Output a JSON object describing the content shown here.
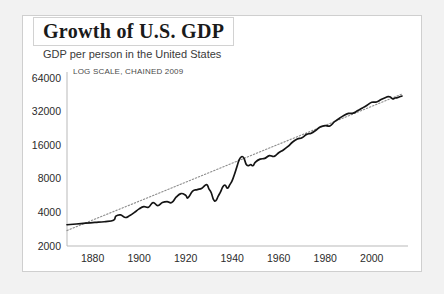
{
  "card": {
    "title": "Growth of U.S. GDP",
    "subtitle": "GDP per person in the United States"
  },
  "chart_data": {
    "type": "line",
    "title": "Growth of U.S. GDP",
    "subtitle": "GDP per person in the United States",
    "annotation": "LOG SCALE, CHAINED 2009",
    "xlabel": "",
    "ylabel": "",
    "yscale": "log2",
    "ylim": [
      2000,
      64000
    ],
    "xlim": [
      1869,
      2013
    ],
    "grid": false,
    "legend": "none",
    "yticks": [
      2000,
      4000,
      8000,
      16000,
      32000,
      64000
    ],
    "ytick_labels": [
      "2000",
      "4000",
      "8000",
      "16000",
      "32000",
      "64000"
    ],
    "xticks": [
      1880,
      1900,
      1920,
      1940,
      1960,
      1980,
      2000
    ],
    "xtick_labels": [
      "1880",
      "1900",
      "1920",
      "1940",
      "1960",
      "1980",
      "2000"
    ],
    "series": [
      {
        "name": "GDP per person",
        "style": "solid",
        "color": "#141414",
        "x": [
          1869,
          1873,
          1877,
          1881,
          1885,
          1889,
          1890,
          1892,
          1894,
          1896,
          1898,
          1900,
          1902,
          1904,
          1906,
          1908,
          1910,
          1912,
          1914,
          1916,
          1918,
          1920,
          1921,
          1923,
          1925,
          1927,
          1929,
          1930,
          1931,
          1932,
          1933,
          1934,
          1935,
          1936,
          1937,
          1938,
          1939,
          1940,
          1941,
          1942,
          1943,
          1944,
          1945,
          1946,
          1947,
          1948,
          1949,
          1950,
          1952,
          1954,
          1956,
          1958,
          1960,
          1962,
          1964,
          1966,
          1968,
          1970,
          1972,
          1974,
          1976,
          1978,
          1980,
          1982,
          1984,
          1986,
          1988,
          1990,
          1992,
          1994,
          1996,
          1998,
          2000,
          2002,
          2004,
          2006,
          2007,
          2008,
          2009,
          2010,
          2011,
          2012,
          2013
        ],
        "values": [
          3100,
          3150,
          3200,
          3250,
          3300,
          3400,
          3700,
          3800,
          3600,
          3750,
          4000,
          4300,
          4500,
          4450,
          4900,
          4600,
          4900,
          5000,
          4900,
          5500,
          5900,
          5700,
          5400,
          6200,
          6400,
          6600,
          7100,
          6500,
          6000,
          5200,
          5100,
          5600,
          6100,
          6800,
          7000,
          6600,
          7100,
          7700,
          8800,
          10200,
          11800,
          12600,
          12300,
          10800,
          10500,
          10700,
          10500,
          11300,
          12000,
          12200,
          12900,
          12700,
          13700,
          14500,
          15600,
          17100,
          18200,
          18700,
          20000,
          20500,
          21800,
          23400,
          24000,
          23800,
          26000,
          27800,
          29600,
          30800,
          31000,
          32700,
          34500,
          36500,
          38800,
          39000,
          41000,
          42800,
          43500,
          43200,
          41600,
          42400,
          42700,
          43500,
          44100
        ]
      },
      {
        "name": "Exponential trend",
        "style": "dotted",
        "color": "#8c8c8c",
        "x": [
          1869,
          2013
        ],
        "values": [
          2750,
          46000
        ]
      }
    ]
  }
}
